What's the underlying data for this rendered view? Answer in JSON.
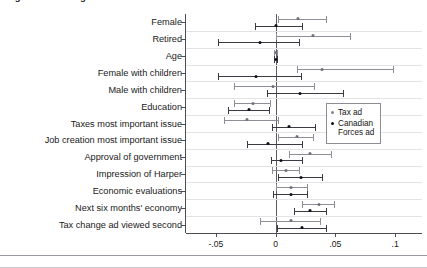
{
  "chart_data": {
    "type": "scatter",
    "title": "Figure 3. Heterogeneous treatment effects",
    "xlabel": "",
    "ylabel": "",
    "xlim": [
      -0.075,
      0.1225
    ],
    "xticks": [
      -0.05,
      0,
      0.05,
      0.1
    ],
    "xticklabels": [
      "-.05",
      "0",
      ".05",
      ".1"
    ],
    "grid": "horizontal",
    "legend_position": "center-right",
    "zero_reference_line": 0,
    "categories": [
      "Female",
      "Retired",
      "Age",
      "Female with children",
      "Male with children",
      "Education",
      "Taxes most important issue",
      "Job creation most important issue",
      "Approval of government",
      "Impression of Harper",
      "Economic evaluations",
      "Next six months' economy",
      "Tax change ad viewed second"
    ],
    "series": [
      {
        "name": "Tax ad",
        "color": "#8e8e96",
        "marker": "dot",
        "estimates": [
          0.019,
          0.031,
          0.0005,
          0.039,
          -0.002,
          -0.019,
          -0.024,
          0.018,
          0.029,
          0.009,
          0.013,
          0.036,
          0.013
        ],
        "ci_low": [
          0.002,
          0.0,
          -0.0015,
          0.018,
          -0.035,
          -0.035,
          -0.043,
          0.002,
          0.011,
          -0.003,
          0.0,
          0.022,
          -0.013
        ],
        "ci_high": [
          0.043,
          0.063,
          0.002,
          0.099,
          0.033,
          -0.004,
          0.003,
          0.032,
          0.047,
          0.02,
          0.027,
          0.05,
          0.038
        ]
      },
      {
        "name": "Canadian\nForces ad",
        "color": "#3a3a42",
        "marker": "dot",
        "estimates": [
          0.0,
          -0.013,
          0.0006,
          -0.016,
          0.02,
          -0.022,
          0.011,
          -0.006,
          0.0045,
          0.021,
          0.013,
          0.029,
          0.022
        ],
        "ci_low": [
          -0.017,
          -0.048,
          -0.001,
          -0.048,
          -0.007,
          -0.04,
          -0.003,
          -0.024,
          -0.004,
          0.002,
          -0.002,
          0.015,
          0.001
        ],
        "ci_high": [
          0.023,
          0.02,
          0.002,
          0.022,
          0.057,
          -0.005,
          0.034,
          0.023,
          0.023,
          0.04,
          0.027,
          0.043,
          0.043
        ]
      }
    ]
  },
  "legend": {
    "items": [
      {
        "label": "Tax ad",
        "color": "#85858e"
      },
      {
        "label": "Canadian\nForces ad",
        "color": "#121216"
      }
    ]
  }
}
